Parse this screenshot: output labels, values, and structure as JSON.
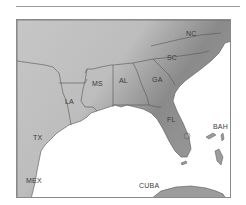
{
  "map": {
    "region": "Southeastern United States",
    "colors": {
      "land": "#9c9c9c",
      "shade_dark": "#7e7e7e",
      "shade_light": "#c4c4c4",
      "water": "#ffffff",
      "border": "#555555"
    },
    "labels": {
      "tx": "TX",
      "la": "LA",
      "ms": "MS",
      "al": "AL",
      "ga": "GA",
      "sc": "SC",
      "nc": "NC",
      "fl": "FL",
      "bah": "BAH",
      "mex": "MEX",
      "cuba": "CUBA"
    }
  }
}
